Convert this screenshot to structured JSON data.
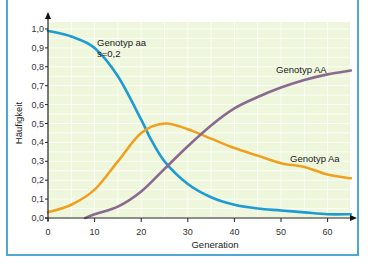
{
  "chart_data": {
    "type": "line",
    "title": "",
    "xlabel": "Generation",
    "ylabel": "Häufigkeit",
    "xlim": [
      0,
      65
    ],
    "ylim": [
      0,
      1.0
    ],
    "x_ticks": [
      "0",
      "10",
      "20",
      "30",
      "40",
      "50",
      "60"
    ],
    "y_ticks": [
      "0,0",
      "0,1",
      "0,2",
      "0,3",
      "0,4",
      "0,5",
      "0,6",
      "0,7",
      "0,8",
      "0,9",
      "1,0"
    ],
    "grid": true,
    "background": "#eef7dc",
    "series": [
      {
        "name": "Genotyp aa",
        "annotation": "s=0,2",
        "color": "#1e9bd2",
        "x": [
          0,
          5,
          10,
          15,
          20,
          22,
          25,
          30,
          35,
          40,
          45,
          50,
          55,
          60,
          65
        ],
        "values": [
          0.99,
          0.96,
          0.9,
          0.75,
          0.52,
          0.42,
          0.3,
          0.18,
          0.11,
          0.07,
          0.05,
          0.04,
          0.03,
          0.02,
          0.02
        ]
      },
      {
        "name": "Genotyp Aa",
        "color": "#f0a020",
        "x": [
          0,
          5,
          10,
          15,
          20,
          25,
          30,
          35,
          40,
          45,
          50,
          55,
          60,
          65
        ],
        "values": [
          0.03,
          0.07,
          0.15,
          0.3,
          0.45,
          0.5,
          0.47,
          0.42,
          0.37,
          0.33,
          0.29,
          0.27,
          0.23,
          0.21
        ]
      },
      {
        "name": "Genotyp AA",
        "color": "#8a6a8e",
        "x": [
          8,
          10,
          15,
          20,
          25,
          30,
          35,
          40,
          45,
          50,
          55,
          60,
          65
        ],
        "values": [
          0.0,
          0.02,
          0.06,
          0.14,
          0.26,
          0.38,
          0.49,
          0.58,
          0.64,
          0.69,
          0.73,
          0.76,
          0.78
        ]
      }
    ],
    "labels": {
      "aa_line1": "Genotyp aa",
      "aa_line2": "s=0,2",
      "AA": "Genotyp AA",
      "Aa": "Genotyp Aa"
    }
  }
}
